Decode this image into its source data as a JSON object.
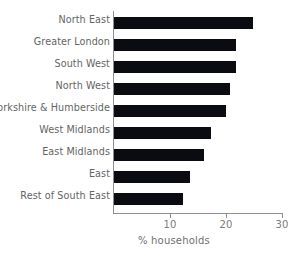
{
  "chart_data": {
    "type": "bar",
    "orientation": "horizontal",
    "title": "",
    "xlabel": "% households",
    "ylabel": "",
    "xlim": [
      0,
      30
    ],
    "xticks": [
      10,
      20,
      30
    ],
    "grid": false,
    "legend": null,
    "bar_color": "#0b0b12",
    "axis_color": "#8d8d8d",
    "text_color": "#646464",
    "categories": [
      "North East",
      "Greater London",
      "South West",
      "North West",
      "Yorkshire & Humberside",
      "West Midlands",
      "East Midlands",
      "East",
      "Rest of South East"
    ],
    "values": [
      24.8,
      21.8,
      21.8,
      20.7,
      20.0,
      17.3,
      16.0,
      13.6,
      12.3
    ]
  }
}
